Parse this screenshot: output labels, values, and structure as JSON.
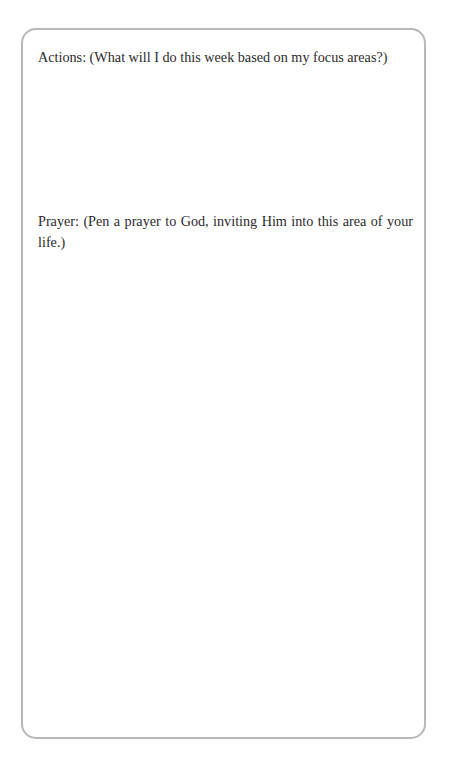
{
  "page": {
    "top_bleed_text": "· ·· ·",
    "background_color": "#ffffff"
  },
  "worksheet": {
    "border_color": "#b8b8b8",
    "text_color": "#2b2b2b",
    "prompts": [
      {
        "id": "actions",
        "label": "Actions: (What will I do this week based on my focus areas?)"
      },
      {
        "id": "prayer",
        "label": "Prayer: (Pen a prayer to God, inviting Him into this area of your life.)"
      }
    ],
    "answer_areas": [
      {
        "id": "actions-answer",
        "value": ""
      },
      {
        "id": "prayer-answer",
        "value": ""
      }
    ]
  }
}
